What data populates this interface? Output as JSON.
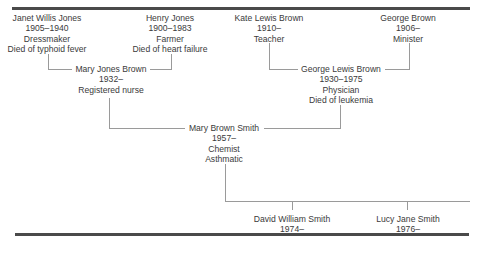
{
  "diagram": {
    "type": "family-tree",
    "header_fragment": "",
    "generations": [
      {
        "level": 1,
        "people": [
          {
            "id": "janet",
            "name": "Janet Willis Jones",
            "dates": "1905–1940",
            "occupation": "Dressmaker",
            "note": "Died of typhoid fever"
          },
          {
            "id": "henry",
            "name": "Henry Jones",
            "dates": "1900–1983",
            "occupation": "Farmer",
            "note": "Died of heart failure"
          },
          {
            "id": "kate",
            "name": "Kate Lewis Brown",
            "dates": "1910–",
            "occupation": "Teacher"
          },
          {
            "id": "george_sr",
            "name": "George Brown",
            "dates": "1906–",
            "occupation": "Minister"
          }
        ]
      },
      {
        "level": 2,
        "people": [
          {
            "id": "mary_jb",
            "name": "Mary Jones Brown",
            "dates": "1932–",
            "occupation": "Registered nurse",
            "parents": [
              "janet",
              "henry"
            ]
          },
          {
            "id": "george_lb",
            "name": "George  Lewis Brown",
            "dates": "1930–1975",
            "occupation": "Physician",
            "note": "Died of leukemia",
            "parents": [
              "kate",
              "george_sr"
            ]
          }
        ]
      },
      {
        "level": 3,
        "people": [
          {
            "id": "mary_bs",
            "name": "Mary Brown Smith",
            "dates": "1957–",
            "occupation": "Chemist",
            "note": "Asthmatic",
            "parents": [
              "mary_jb",
              "george_lb"
            ]
          }
        ]
      },
      {
        "level": 4,
        "people": [
          {
            "id": "david",
            "name": "David William Smith",
            "dates": "1974–",
            "parents": [
              "mary_bs"
            ]
          },
          {
            "id": "lucy",
            "name": "Lucy Jane Smith",
            "dates": "1976–",
            "parents": [
              "mary_bs"
            ]
          }
        ]
      }
    ]
  }
}
